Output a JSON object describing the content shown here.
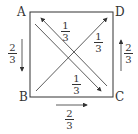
{
  "diagram": {
    "vertices": {
      "A": "A",
      "B": "B",
      "C": "C",
      "D": "D"
    },
    "edges": [
      {
        "from": "A",
        "to": "B",
        "weight_num": "2",
        "weight_den": "3"
      },
      {
        "from": "B",
        "to": "C",
        "weight_num": "2",
        "weight_den": "3"
      },
      {
        "from": "C",
        "to": "D",
        "weight_num": "2",
        "weight_den": "3"
      },
      {
        "from": "A",
        "to": "C",
        "weight_num": "1",
        "weight_den": "3"
      },
      {
        "from": "C",
        "to": "A",
        "weight_num": "1",
        "weight_den": "3"
      },
      {
        "from": "B",
        "to": "D",
        "weight_num": "1",
        "weight_den": "3"
      }
    ]
  }
}
